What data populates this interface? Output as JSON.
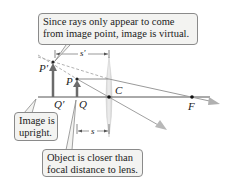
{
  "diagram": {
    "type": "ray-diagram-converging-lens-virtual-image",
    "callouts": {
      "virtual": "Since rays only appear to come from image point, image is virtual.",
      "virtual_line1": "Since rays only appear to come",
      "virtual_line2": "from image point, image is virtual.",
      "upright_line1": "Image is",
      "upright_line2": "upright.",
      "object_line1": "Object is closer than",
      "object_line2": "focal distance to lens."
    },
    "labels": {
      "image_tip": "P′",
      "object_tip": "P",
      "image_base": "Q′",
      "object_base": "Q",
      "lens_center": "C",
      "focal_point": "F",
      "image_distance": "s′",
      "object_distance": "s"
    },
    "colors": {
      "arrow": "#6b6b6b",
      "ray": "#9a9a9a",
      "dashed_ray": "#a8a8a8",
      "lens": "#c9c9c9",
      "callout_bg": "#f3f3f1",
      "callout_border": "#8a8a8a"
    }
  }
}
